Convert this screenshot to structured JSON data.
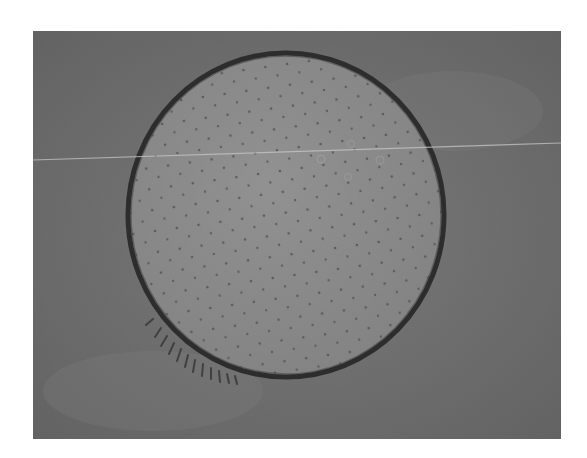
{
  "figure": {
    "kind": "grayscale micrograph",
    "colors": {
      "background": "#6f6f6f",
      "disc": "#8f8f8f",
      "rim": "#1c1c1c",
      "scratch_line": "#d8d8d8",
      "dots": "#4a4a4a"
    },
    "features": [
      "dark circular rim",
      "regular dot pattern inside disc",
      "thin bright horizontal streak",
      "spiky fringe on lower-left rim"
    ]
  }
}
